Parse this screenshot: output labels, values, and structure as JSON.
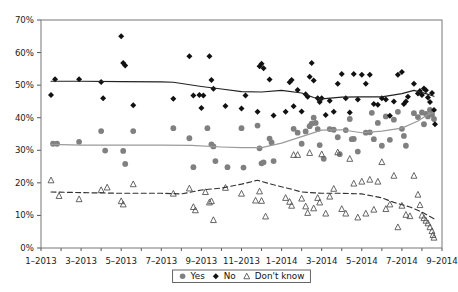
{
  "chart_data": {
    "type": "scatter",
    "title": "",
    "subtitle": "",
    "xlabel": "",
    "ylabel": "",
    "ylim": [
      0,
      70
    ],
    "ytick_values": [
      0,
      10,
      20,
      30,
      40,
      50,
      60,
      70
    ],
    "ytick_labels": [
      "0%",
      "10%",
      "20%",
      "30%",
      "40%",
      "50%",
      "60%",
      "70%"
    ],
    "xlim": [
      "1-2013",
      "10-2014"
    ],
    "xtick_labels": [
      "1–2013",
      "3–2013",
      "5–2013",
      "7–2013",
      "9–2013",
      "11–2013",
      "1–2014",
      "3–2014",
      "5–2014",
      "7–2014",
      "9–2014"
    ],
    "xtick_months": [
      0,
      2,
      4,
      6,
      8,
      10,
      12,
      14,
      16,
      18,
      20
    ],
    "grid": false,
    "legend_position": "bottom-center",
    "legend": [
      {
        "name": "Yes",
        "marker": "circle",
        "color": "#808080",
        "fill": "solid"
      },
      {
        "name": "No",
        "marker": "diamond",
        "color": "#111111",
        "fill": "solid"
      },
      {
        "name": "Don't know",
        "marker": "triangle",
        "color": "#555555",
        "fill": "open"
      }
    ],
    "series": [
      {
        "name": "Yes",
        "marker": "circle",
        "color": "#808080",
        "line_color": "#9a9a9a",
        "line_style": "solid",
        "points": [
          [
            1.6,
            32.0
          ],
          [
            1.8,
            32.0
          ],
          [
            2.9,
            32.6
          ],
          [
            4.0,
            35.9
          ],
          [
            4.2,
            29.9
          ],
          [
            5.1,
            29.8
          ],
          [
            5.2,
            25.8
          ],
          [
            5.6,
            35.9
          ],
          [
            7.6,
            36.8
          ],
          [
            8.4,
            33.7
          ],
          [
            8.6,
            24.8
          ],
          [
            9.3,
            36.8
          ],
          [
            9.5,
            31.8
          ],
          [
            9.6,
            31.2
          ],
          [
            9.7,
            26.7
          ],
          [
            10.3,
            24.8
          ],
          [
            11.0,
            36.8
          ],
          [
            11.1,
            24.7
          ],
          [
            11.8,
            37.6
          ],
          [
            11.9,
            30.6
          ],
          [
            12.0,
            26.0
          ],
          [
            12.1,
            26.3
          ],
          [
            12.4,
            33.6
          ],
          [
            12.5,
            32.4
          ],
          [
            12.6,
            26.7
          ],
          [
            13.6,
            36.6
          ],
          [
            13.8,
            35.4
          ],
          [
            14.0,
            32.0
          ],
          [
            14.2,
            35.8
          ],
          [
            14.4,
            37.4
          ],
          [
            14.5,
            38.2
          ],
          [
            14.6,
            40.0
          ],
          [
            14.7,
            38.4
          ],
          [
            14.8,
            36.5
          ],
          [
            14.9,
            31.6
          ],
          [
            15.1,
            27.4
          ],
          [
            15.4,
            36.5
          ],
          [
            15.6,
            36.3
          ],
          [
            15.8,
            34.0
          ],
          [
            15.9,
            28.8
          ],
          [
            16.2,
            36.2
          ],
          [
            16.4,
            39.6
          ],
          [
            16.5,
            33.4
          ],
          [
            16.6,
            33.5
          ],
          [
            16.8,
            29.6
          ],
          [
            17.2,
            35.4
          ],
          [
            17.4,
            35.5
          ],
          [
            17.5,
            41.5
          ],
          [
            17.6,
            33.4
          ],
          [
            17.8,
            38.4
          ],
          [
            18.0,
            31.4
          ],
          [
            18.2,
            40.4
          ],
          [
            18.4,
            33.2
          ],
          [
            18.6,
            39.4
          ],
          [
            18.8,
            41.8
          ],
          [
            19.0,
            36.6
          ],
          [
            19.1,
            34.4
          ],
          [
            19.2,
            31.4
          ],
          [
            19.6,
            41.4
          ],
          [
            19.8,
            40.2
          ],
          [
            20.0,
            41.6
          ],
          [
            20.1,
            38.0
          ],
          [
            20.2,
            41.2
          ],
          [
            20.3,
            40.4
          ],
          [
            20.4,
            42.4
          ],
          [
            20.5,
            41.0
          ],
          [
            20.6,
            39.6
          ]
        ],
        "trend": [
          [
            1.5,
            31.8
          ],
          [
            3.0,
            31.6
          ],
          [
            5.0,
            31.6
          ],
          [
            7.0,
            31.6
          ],
          [
            8.5,
            31.5
          ],
          [
            10.0,
            31.0
          ],
          [
            11.0,
            30.8
          ],
          [
            12.0,
            30.8
          ],
          [
            13.0,
            32.2
          ],
          [
            14.0,
            34.2
          ],
          [
            15.0,
            36.2
          ],
          [
            16.0,
            36.3
          ],
          [
            17.0,
            35.4
          ],
          [
            18.0,
            35.9
          ],
          [
            19.0,
            36.8
          ],
          [
            19.8,
            39.0
          ],
          [
            20.3,
            41.0
          ],
          [
            20.6,
            41.6
          ]
        ]
      },
      {
        "name": "No",
        "marker": "diamond",
        "color": "#111111",
        "line_color": "#222222",
        "line_style": "solid",
        "points": [
          [
            1.5,
            47.0
          ],
          [
            1.7,
            51.8
          ],
          [
            2.9,
            51.8
          ],
          [
            4.0,
            51.0
          ],
          [
            4.1,
            46.0
          ],
          [
            5.0,
            65.0
          ],
          [
            5.1,
            56.8
          ],
          [
            5.2,
            56.0
          ],
          [
            5.6,
            43.8
          ],
          [
            7.6,
            45.8
          ],
          [
            8.4,
            58.9
          ],
          [
            8.6,
            46.8
          ],
          [
            8.9,
            47.0
          ],
          [
            9.0,
            43.0
          ],
          [
            9.1,
            46.8
          ],
          [
            9.4,
            58.9
          ],
          [
            9.5,
            51.6
          ],
          [
            9.6,
            48.9
          ],
          [
            10.2,
            43.6
          ],
          [
            11.0,
            42.8
          ],
          [
            11.2,
            46.8
          ],
          [
            11.8,
            41.8
          ],
          [
            11.9,
            55.8
          ],
          [
            12.0,
            56.6
          ],
          [
            12.1,
            55.2
          ],
          [
            12.4,
            51.7
          ],
          [
            12.6,
            40.7
          ],
          [
            13.2,
            41.8
          ],
          [
            13.4,
            50.9
          ],
          [
            13.5,
            51.6
          ],
          [
            13.6,
            43.5
          ],
          [
            13.8,
            48.5
          ],
          [
            14.0,
            41.9
          ],
          [
            14.2,
            47.2
          ],
          [
            14.3,
            46.4
          ],
          [
            14.4,
            52.6
          ],
          [
            14.5,
            56.8
          ],
          [
            14.6,
            51.4
          ],
          [
            14.8,
            46.0
          ],
          [
            14.9,
            44.8
          ],
          [
            15.0,
            46.0
          ],
          [
            15.2,
            40.8
          ],
          [
            15.4,
            45.2
          ],
          [
            15.6,
            41.8
          ],
          [
            15.8,
            50.4
          ],
          [
            16.0,
            53.4
          ],
          [
            16.2,
            46.0
          ],
          [
            16.4,
            41.6
          ],
          [
            16.6,
            53.4
          ],
          [
            16.8,
            45.6
          ],
          [
            17.0,
            53.2
          ],
          [
            17.2,
            50.4
          ],
          [
            17.4,
            53.2
          ],
          [
            17.6,
            44.2
          ],
          [
            17.8,
            44.0
          ],
          [
            18.0,
            46.0
          ],
          [
            18.2,
            45.6
          ],
          [
            18.4,
            40.6
          ],
          [
            18.6,
            45.0
          ],
          [
            18.8,
            53.2
          ],
          [
            19.0,
            54.0
          ],
          [
            19.1,
            44.2
          ],
          [
            19.2,
            45.0
          ],
          [
            19.3,
            46.4
          ],
          [
            19.6,
            50.4
          ],
          [
            19.8,
            47.4
          ],
          [
            19.9,
            48.2
          ],
          [
            20.0,
            47.0
          ],
          [
            20.1,
            49.0
          ],
          [
            20.2,
            48.4
          ],
          [
            20.3,
            46.2
          ],
          [
            20.4,
            44.8
          ],
          [
            20.5,
            47.6
          ],
          [
            20.6,
            42.4
          ],
          [
            20.65,
            38.0
          ]
        ],
        "trend": [
          [
            1.5,
            51.2
          ],
          [
            3.0,
            51.2
          ],
          [
            5.0,
            51.1
          ],
          [
            7.0,
            51.0
          ],
          [
            7.6,
            50.9
          ],
          [
            9.0,
            49.6
          ],
          [
            10.0,
            48.8
          ],
          [
            11.0,
            48.0
          ],
          [
            12.0,
            47.9
          ],
          [
            13.0,
            48.4
          ],
          [
            14.0,
            47.6
          ],
          [
            14.6,
            46.2
          ],
          [
            15.0,
            45.8
          ],
          [
            16.0,
            46.3
          ],
          [
            17.0,
            46.4
          ],
          [
            18.0,
            46.4
          ],
          [
            19.0,
            47.4
          ],
          [
            19.6,
            48.4
          ],
          [
            20.2,
            47.4
          ],
          [
            20.6,
            46.6
          ]
        ]
      },
      {
        "name": "Don't know",
        "marker": "triangle",
        "color": "#555555",
        "line_color": "#333333",
        "line_style": "dashed",
        "points": [
          [
            1.5,
            20.8
          ],
          [
            1.9,
            16.0
          ],
          [
            2.9,
            15.0
          ],
          [
            4.0,
            17.8
          ],
          [
            4.3,
            18.6
          ],
          [
            5.0,
            14.4
          ],
          [
            5.1,
            13.4
          ],
          [
            5.6,
            19.6
          ],
          [
            7.6,
            16.7
          ],
          [
            8.4,
            18.3
          ],
          [
            8.6,
            12.6
          ],
          [
            8.7,
            11.6
          ],
          [
            9.2,
            17.2
          ],
          [
            9.4,
            14.0
          ],
          [
            9.5,
            14.4
          ],
          [
            9.6,
            8.6
          ],
          [
            10.2,
            18.5
          ],
          [
            11.0,
            16.7
          ],
          [
            11.7,
            14.6
          ],
          [
            11.9,
            17.4
          ],
          [
            12.0,
            14.5
          ],
          [
            12.2,
            9.7
          ],
          [
            13.2,
            15.4
          ],
          [
            13.4,
            14.2
          ],
          [
            13.5,
            13.0
          ],
          [
            13.6,
            28.6
          ],
          [
            13.8,
            28.6
          ],
          [
            14.0,
            15.2
          ],
          [
            14.2,
            12.8
          ],
          [
            14.3,
            10.8
          ],
          [
            14.4,
            29.2
          ],
          [
            14.6,
            12.2
          ],
          [
            14.8,
            15.4
          ],
          [
            14.9,
            14.0
          ],
          [
            15.0,
            28.8
          ],
          [
            15.2,
            10.6
          ],
          [
            15.4,
            15.8
          ],
          [
            15.6,
            18.2
          ],
          [
            15.8,
            29.4
          ],
          [
            16.0,
            12.0
          ],
          [
            16.2,
            10.6
          ],
          [
            16.4,
            27.4
          ],
          [
            16.6,
            19.8
          ],
          [
            16.8,
            9.4
          ],
          [
            17.0,
            20.4
          ],
          [
            17.2,
            10.6
          ],
          [
            17.4,
            21.0
          ],
          [
            17.6,
            11.8
          ],
          [
            17.8,
            20.4
          ],
          [
            18.0,
            26.4
          ],
          [
            18.2,
            12.0
          ],
          [
            18.4,
            13.4
          ],
          [
            18.6,
            22.2
          ],
          [
            18.8,
            6.4
          ],
          [
            19.0,
            13.0
          ],
          [
            19.2,
            10.2
          ],
          [
            19.4,
            9.8
          ],
          [
            19.6,
            22.2
          ],
          [
            19.8,
            16.4
          ],
          [
            19.9,
            13.2
          ],
          [
            20.0,
            10.0
          ],
          [
            20.1,
            9.2
          ],
          [
            20.2,
            8.4
          ],
          [
            20.3,
            7.6
          ],
          [
            20.4,
            6.4
          ],
          [
            20.5,
            5.2
          ],
          [
            20.55,
            4.0
          ],
          [
            20.6,
            3.2
          ]
        ],
        "trend": [
          [
            1.5,
            17.2
          ],
          [
            3.0,
            17.0
          ],
          [
            5.0,
            16.8
          ],
          [
            7.0,
            16.8
          ],
          [
            8.0,
            16.6
          ],
          [
            9.0,
            17.8
          ],
          [
            10.0,
            18.4
          ],
          [
            11.0,
            19.6
          ],
          [
            11.8,
            20.8
          ],
          [
            12.6,
            19.4
          ],
          [
            13.4,
            18.2
          ],
          [
            14.0,
            17.2
          ],
          [
            15.0,
            16.8
          ],
          [
            16.0,
            16.8
          ],
          [
            17.0,
            16.6
          ],
          [
            18.0,
            15.4
          ],
          [
            18.6,
            14.0
          ],
          [
            19.4,
            12.6
          ],
          [
            20.0,
            11.0
          ],
          [
            20.6,
            9.0
          ]
        ]
      }
    ]
  }
}
